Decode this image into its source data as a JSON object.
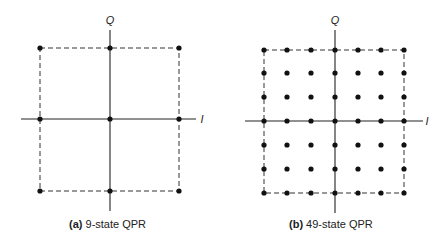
{
  "figures": [
    {
      "id": "a",
      "caption_tag": "(a)",
      "caption_text": " 9-state QPR",
      "axis_labels": {
        "vertical": "Q",
        "horizontal": "I"
      },
      "grid_size": 3,
      "origin": {
        "x": 110,
        "y": 119
      },
      "xs": [
        40,
        110,
        179
      ],
      "ys": [
        48,
        119,
        191
      ],
      "q_axis": {
        "x": 110,
        "y1": 30,
        "y2": 211
      },
      "i_axis": {
        "y": 119,
        "x1": 21,
        "x2": 196
      },
      "q_label_pos": {
        "x": 110,
        "y": 24
      },
      "i_label_pos": {
        "x": 202,
        "y": 123
      },
      "caption_pos": {
        "x": 69,
        "y": 225
      }
    },
    {
      "id": "b",
      "caption_tag": "(b)",
      "caption_text": " 49-state QPR",
      "axis_labels": {
        "vertical": "Q",
        "horizontal": "I"
      },
      "grid_size": 7,
      "origin": {
        "x": 335,
        "y": 121
      },
      "xs": [
        264,
        287,
        311,
        335,
        358,
        381,
        404
      ],
      "ys": [
        50,
        73,
        97,
        121,
        145,
        169,
        193
      ],
      "q_axis": {
        "x": 335,
        "y1": 30,
        "y2": 213
      },
      "i_axis": {
        "y": 121,
        "x1": 245,
        "x2": 423
      },
      "q_label_pos": {
        "x": 335,
        "y": 24
      },
      "i_label_pos": {
        "x": 427,
        "y": 125
      },
      "caption_pos": {
        "x": 289,
        "y": 225
      }
    }
  ]
}
